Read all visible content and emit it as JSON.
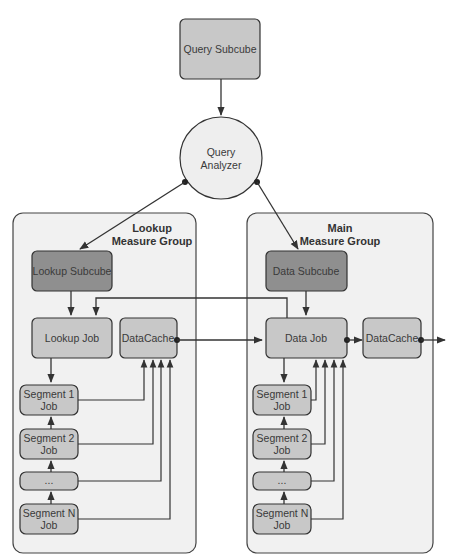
{
  "diagram": {
    "query_subcube": {
      "label": "Query Subcube"
    },
    "query_analyzer": {
      "line1": "Query",
      "line2": "Analyzer"
    },
    "lookup_group": {
      "title1": "Lookup",
      "title2": "Measure Group",
      "subcube": "Lookup Subcube",
      "job": "Lookup Job",
      "cache": "DataCache",
      "segments": [
        {
          "line1": "Segment 1",
          "line2": "Job"
        },
        {
          "line1": "Segment 2",
          "line2": "Job"
        },
        {
          "line1": "...",
          "line2": ""
        },
        {
          "line1": "Segment N",
          "line2": "Job"
        }
      ]
    },
    "main_group": {
      "title1": "Main",
      "title2": "Measure Group",
      "subcube": "Data Subcube",
      "job": "Data Job",
      "cache": "DataCache",
      "segments": [
        {
          "line1": "Segment 1",
          "line2": "Job"
        },
        {
          "line1": "Segment 2",
          "line2": "Job"
        },
        {
          "line1": "...",
          "line2": ""
        },
        {
          "line1": "Segment N",
          "line2": "Job"
        }
      ]
    },
    "colors": {
      "group_fill": "#f1f1f1",
      "node_fill": "#c8c8c8",
      "subcube_fill": "#8f8f8f",
      "analyzer_fill": "#eeeeee",
      "stroke": "#333333"
    }
  }
}
